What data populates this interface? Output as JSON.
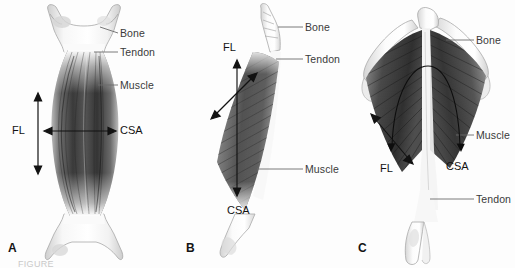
{
  "figure": {
    "background_color": "#fdfdfd",
    "label_color": "#3a3a3a",
    "leader_color": "#6b6b6b",
    "arrow_color": "#121212",
    "muscle_fill_dark": "#3d3d3d",
    "muscle_fill_mid": "#6f6f6f",
    "bone_fill": "#efefef",
    "tendon_fill": "#f6f6f6"
  },
  "panels": [
    {
      "letter": "A",
      "name": "fusiform-muscle",
      "labels": [
        {
          "text": "Bone",
          "name": "label-bone"
        },
        {
          "text": "Tendon",
          "name": "label-tendon"
        },
        {
          "text": "Muscle",
          "name": "label-muscle"
        }
      ],
      "measures": [
        {
          "text": "FL",
          "name": "measure-fl"
        },
        {
          "text": "CSA",
          "name": "measure-csa"
        }
      ]
    },
    {
      "letter": "B",
      "name": "unipennate-muscle",
      "labels": [
        {
          "text": "Bone",
          "name": "label-bone"
        },
        {
          "text": "Tendon",
          "name": "label-tendon"
        },
        {
          "text": "Muscle",
          "name": "label-muscle"
        }
      ],
      "measures": [
        {
          "text": "FL",
          "name": "measure-fl"
        },
        {
          "text": "CSA",
          "name": "measure-csa"
        }
      ]
    },
    {
      "letter": "C",
      "name": "bipennate-muscle",
      "labels": [
        {
          "text": "Bone",
          "name": "label-bone"
        },
        {
          "text": "Muscle",
          "name": "label-muscle"
        },
        {
          "text": "Tendon",
          "name": "label-tendon"
        }
      ],
      "measures": [
        {
          "text": "FL",
          "name": "measure-fl"
        },
        {
          "text": "CSA",
          "name": "measure-csa"
        }
      ]
    }
  ],
  "panel_a": {
    "letter": "A",
    "bone": "Bone",
    "tendon": "Tendon",
    "muscle": "Muscle",
    "fl": "FL",
    "csa": "CSA"
  },
  "panel_b": {
    "letter": "B",
    "bone": "Bone",
    "tendon": "Tendon",
    "muscle": "Muscle",
    "fl": "FL",
    "csa": "CSA"
  },
  "panel_c": {
    "letter": "C",
    "bone": "Bone",
    "muscle": "Muscle",
    "tendon": "Tendon",
    "fl": "FL",
    "csa": "CSA"
  },
  "footer": {
    "cut_caption": "FIGURE"
  }
}
